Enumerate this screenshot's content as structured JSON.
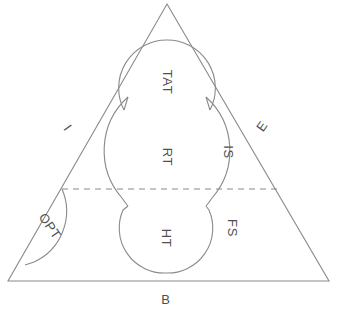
{
  "figure": {
    "type": "venn-triangle-schematic",
    "background_color": "#ffffff",
    "line_color": "#8a8a8a",
    "text_color": "#4f4f4f"
  },
  "triangle": {
    "name": "outer-triangle",
    "apex": [
      167,
      4
    ],
    "bottom_left": [
      8,
      281
    ],
    "bottom_right": [
      329,
      281
    ],
    "corner_labels": {
      "left_edge": "I",
      "right_edge": "E",
      "bottom_edge": "B"
    }
  },
  "divider": {
    "name": "horizontal-dashed-divider",
    "style": "dashed",
    "y": 189,
    "x_start": 62,
    "x_end": 277
  },
  "regions": [
    {
      "id": "tat",
      "label": "TAT",
      "orientation": "rotated-90",
      "cx": 167,
      "cy": 88,
      "r": 48
    },
    {
      "id": "rt",
      "label": "RT",
      "orientation": "rotated-90",
      "cx": 167,
      "cy": 155,
      "r": 72
    },
    {
      "id": "ht",
      "label": "HT",
      "orientation": "rotated-90",
      "cx": 166,
      "cy": 228,
      "r": 45
    },
    {
      "id": "is",
      "label": "IS",
      "orientation": "rotated-90",
      "cx": 227,
      "cy": 152
    },
    {
      "id": "fs",
      "label": "FS",
      "orientation": "rotated-90",
      "cx": 231,
      "cy": 228
    },
    {
      "id": "opt",
      "label": "OPT",
      "orientation": "rotated-diagonal",
      "cx": 49,
      "cy": 226
    }
  ],
  "labels": {
    "tat": "TAT",
    "rt": "RT",
    "ht": "HT",
    "is": "IS",
    "fs": "FS",
    "opt": "OPT",
    "i": "I",
    "e": "E",
    "b": "B"
  },
  "label_positions": {
    "tat": [
      167,
      82
    ],
    "rt": [
      167,
      157
    ],
    "ht": [
      166,
      238
    ],
    "is": [
      228,
      152
    ],
    "fs": [
      232,
      228
    ],
    "opt": [
      50,
      226
    ],
    "i": [
      68,
      128
    ],
    "e": [
      262,
      126
    ],
    "b": [
      166,
      299
    ]
  }
}
